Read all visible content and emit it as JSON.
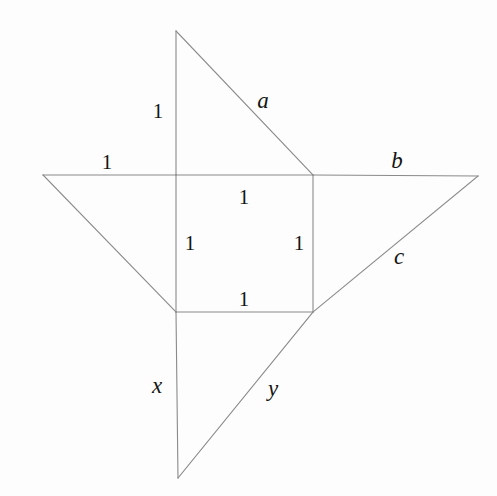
{
  "figure": {
    "kind": "geometric-diagram",
    "background_color": "#fdfdfd",
    "stroke_color": "#8a8a8a",
    "stroke_width": 1.1,
    "text_color": "#141414",
    "canvas": {
      "width": 497,
      "height": 496
    },
    "vertices": {
      "top_apex": {
        "x": 176,
        "y": 31
      },
      "left_apex": {
        "x": 43,
        "y": 175
      },
      "right_apex": {
        "x": 478,
        "y": 176
      },
      "bottom_apex": {
        "x": 178,
        "y": 478
      },
      "square_top_left": {
        "x": 176,
        "y": 175
      },
      "square_top_right": {
        "x": 313,
        "y": 175
      },
      "square_bottom_right": {
        "x": 313,
        "y": 312
      },
      "square_bottom_left": {
        "x": 176,
        "y": 312
      }
    },
    "segments": [
      {
        "name": "upper-vertical-leg",
        "x1": 176,
        "y1": 31,
        "x2": 176,
        "y2": 175,
        "length_label": "1"
      },
      {
        "name": "hypotenuse-a",
        "x1": 176,
        "y1": 31,
        "x2": 313,
        "y2": 175,
        "length_label": "a"
      },
      {
        "name": "horizontal-left-leg",
        "x1": 43,
        "y1": 175,
        "x2": 176,
        "y2": 175,
        "length_label": "1"
      },
      {
        "name": "square-top-side",
        "x1": 176,
        "y1": 175,
        "x2": 313,
        "y2": 175,
        "length_label": "1"
      },
      {
        "name": "hypotenuse-b",
        "x1": 313,
        "y1": 175,
        "x2": 478,
        "y2": 176,
        "length_label": "b"
      },
      {
        "name": "hypotenuse-left-diagonal",
        "x1": 43,
        "y1": 175,
        "x2": 176,
        "y2": 312,
        "length_label": ""
      },
      {
        "name": "square-left-side",
        "x1": 176,
        "y1": 175,
        "x2": 176,
        "y2": 312,
        "length_label": "1"
      },
      {
        "name": "square-right-side",
        "x1": 313,
        "y1": 175,
        "x2": 313,
        "y2": 312,
        "length_label": "1"
      },
      {
        "name": "hypotenuse-c",
        "x1": 478,
        "y1": 176,
        "x2": 313,
        "y2": 312,
        "length_label": "c"
      },
      {
        "name": "square-bottom-side",
        "x1": 176,
        "y1": 312,
        "x2": 313,
        "y2": 312,
        "length_label": "1"
      },
      {
        "name": "lower-vertical-leg-x",
        "x1": 176,
        "y1": 312,
        "x2": 178,
        "y2": 478,
        "length_label": "x"
      },
      {
        "name": "hypotenuse-y",
        "x1": 178,
        "y1": 478,
        "x2": 313,
        "y2": 312,
        "length_label": "y"
      }
    ],
    "labels": [
      {
        "id": "upper-leg-1",
        "text": "1",
        "x": 158,
        "y": 111,
        "style": "numeral"
      },
      {
        "id": "hypotenuse-a",
        "text": "a",
        "x": 263,
        "y": 100,
        "style": "variable"
      },
      {
        "id": "horizontal-left-1",
        "text": "1",
        "x": 107,
        "y": 162,
        "style": "numeral"
      },
      {
        "id": "hypotenuse-b",
        "text": "b",
        "x": 397,
        "y": 160,
        "style": "variable"
      },
      {
        "id": "square-top-1",
        "text": "1",
        "x": 244,
        "y": 197,
        "style": "numeral"
      },
      {
        "id": "square-left-1",
        "text": "1",
        "x": 190,
        "y": 243,
        "style": "numeral"
      },
      {
        "id": "square-right-1",
        "text": "1",
        "x": 299,
        "y": 243,
        "style": "numeral"
      },
      {
        "id": "hypotenuse-c",
        "text": "c",
        "x": 399,
        "y": 256,
        "style": "variable"
      },
      {
        "id": "square-bottom-1",
        "text": "1",
        "x": 244,
        "y": 299,
        "style": "numeral"
      },
      {
        "id": "segment-x",
        "text": "x",
        "x": 157,
        "y": 385,
        "style": "variable"
      },
      {
        "id": "segment-y",
        "text": "y",
        "x": 273,
        "y": 388,
        "style": "variable"
      }
    ]
  }
}
